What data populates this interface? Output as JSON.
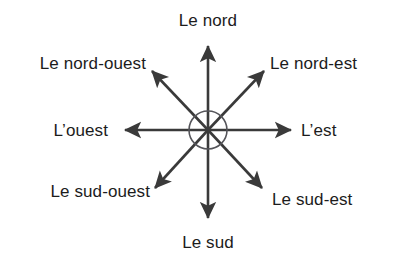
{
  "diagram": {
    "type": "compass-rose",
    "language": "fr",
    "background_color": "#ffffff",
    "stroke_color": "#3a3a3a",
    "text_color": "#1c1c1c",
    "center": {
      "x": 208,
      "y": 130,
      "circle_radius": 19
    },
    "directions": [
      {
        "key": "north",
        "label": "Le nord",
        "bearing_degrees": 0,
        "arrow_tip": {
          "x": 208,
          "y": 42
        }
      },
      {
        "key": "north-east",
        "label": "Le nord-est",
        "bearing_degrees": 45,
        "arrow_tip": {
          "x": 268,
          "y": 67
        }
      },
      {
        "key": "east",
        "label": "L’est",
        "bearing_degrees": 90,
        "arrow_tip": {
          "x": 295,
          "y": 130
        }
      },
      {
        "key": "south-east",
        "label": "Le sud-est",
        "bearing_degrees": 135,
        "arrow_tip": {
          "x": 266,
          "y": 192
        }
      },
      {
        "key": "south",
        "label": "Le sud",
        "bearing_degrees": 180,
        "arrow_tip": {
          "x": 208,
          "y": 222
        }
      },
      {
        "key": "south-west",
        "label": "Le sud-ouest",
        "bearing_degrees": 225,
        "arrow_tip": {
          "x": 151,
          "y": 192
        }
      },
      {
        "key": "west",
        "label": "L’ouest",
        "bearing_degrees": 270,
        "arrow_tip": {
          "x": 121,
          "y": 130
        }
      },
      {
        "key": "north-west",
        "label": "Le nord-ouest",
        "bearing_degrees": 315,
        "arrow_tip": {
          "x": 148,
          "y": 67
        }
      }
    ]
  }
}
